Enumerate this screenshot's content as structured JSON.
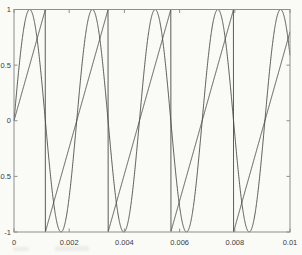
{
  "chart_data": {
    "type": "line",
    "title": "",
    "xlabel": "",
    "ylabel": "",
    "xlim": [
      0,
      0.01
    ],
    "ylim": [
      -1,
      1
    ],
    "grid": false,
    "legend": "none",
    "x_ticks": [
      0,
      0.002,
      0.004,
      0.006,
      0.008,
      0.01
    ],
    "x_tick_labels": [
      "0",
      "0.002",
      "0.004",
      "0.006",
      "0.008",
      "0.01"
    ],
    "y_ticks": [
      -1,
      -0.5,
      0,
      0.5,
      1
    ],
    "y_tick_labels": [
      "-1",
      "-0.5",
      "0",
      "0.5",
      "1"
    ],
    "series": [
      {
        "name": "sine-wave",
        "waveform": "sine",
        "frequency_hz": 440,
        "amplitude": 1,
        "phase_deg": 0,
        "color": "#4a4a4a"
      },
      {
        "name": "sawtooth-wave",
        "waveform": "sawtooth",
        "frequency_hz": 440,
        "amplitude": 1,
        "phase_deg": 0,
        "color": "#4a4a4a"
      }
    ],
    "axis_color": "#8e8e8e",
    "tick_label_color": "#3c3c3c",
    "background_color": "#fafaf7"
  }
}
